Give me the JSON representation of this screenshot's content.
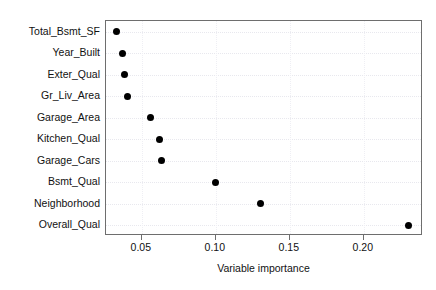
{
  "chart_data": {
    "type": "scatter",
    "subtype": "cleveland-dot-plot",
    "title": "",
    "xlabel": "Variable importance",
    "ylabel": "",
    "categories": [
      "Total_Bsmt_SF",
      "Year_Built",
      "Exter_Qual",
      "Gr_Liv_Area",
      "Garage_Area",
      "Kitchen_Qual",
      "Garage_Cars",
      "Bsmt_Qual",
      "Neighborhood",
      "Overall_Qual"
    ],
    "values": [
      0.033,
      0.037,
      0.038,
      0.04,
      0.056,
      0.062,
      0.063,
      0.1,
      0.13,
      0.23
    ],
    "series": [
      {
        "name": "Variable importance",
        "values": [
          0.033,
          0.037,
          0.038,
          0.04,
          0.056,
          0.062,
          0.063,
          0.1,
          0.13,
          0.23
        ]
      }
    ],
    "points": [
      {
        "category": "Total_Bsmt_SF",
        "value": 0.033
      },
      {
        "category": "Year_Built",
        "value": 0.037
      },
      {
        "category": "Exter_Qual",
        "value": 0.038
      },
      {
        "category": "Gr_Liv_Area",
        "value": 0.04
      },
      {
        "category": "Garage_Area",
        "value": 0.056
      },
      {
        "category": "Kitchen_Qual",
        "value": 0.062
      },
      {
        "category": "Garage_Cars",
        "value": 0.063
      },
      {
        "category": "Bsmt_Qual",
        "value": 0.1
      },
      {
        "category": "Neighborhood",
        "value": 0.13
      },
      {
        "category": "Overall_Qual",
        "value": 0.23
      }
    ],
    "xlim": [
      0.0258,
      0.24
    ],
    "xticks": [
      0.05,
      0.1,
      0.15,
      0.2
    ],
    "xticklabels": [
      "0.05",
      "0.10",
      "0.15",
      "0.20"
    ],
    "grid": true,
    "grid_style": "dotted",
    "legend": null,
    "marker": "filled-circle",
    "marker_color": "#000000",
    "panel_border_color": "#6e6e6e",
    "gridline_color": "#e8e8ee",
    "background_color": "#ffffff"
  }
}
